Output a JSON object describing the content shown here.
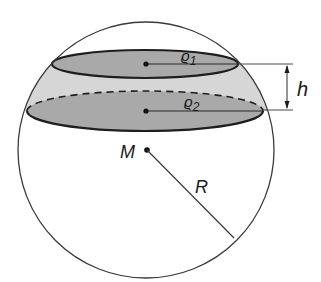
{
  "diagram": {
    "colors": {
      "outline": "#3a3a3a",
      "ellipse_fill": "#a9a9a9",
      "zone_fill": "#d6d6d6",
      "ellipse_stroke": "#1e1e1e",
      "background": "#ffffff"
    },
    "sphere": {
      "cx": 146,
      "cy": 150,
      "r": 128
    },
    "top_circle": {
      "cx": 145,
      "cy": 64,
      "rx": 93,
      "ry": 14,
      "radius_label": "ρ",
      "radius_subscript": "1"
    },
    "bottom_circle": {
      "cx": 145,
      "cy": 111,
      "rx": 118,
      "ry": 20,
      "radius_label": "ρ",
      "radius_subscript": "2"
    },
    "labels": {
      "center": "M",
      "radius": "R",
      "height": "h",
      "rho1": "ϱ",
      "rho1_sub": "1",
      "rho2": "ϱ",
      "rho2_sub": "2"
    }
  }
}
